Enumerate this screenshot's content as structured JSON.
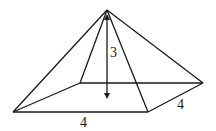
{
  "diagram": {
    "type": "square pyramid",
    "labels": {
      "height": "3",
      "base_front_edge": "4",
      "base_side_edge": "4"
    },
    "colors": {
      "stroke": "#1a1a1a",
      "background": "#ffffff"
    }
  }
}
